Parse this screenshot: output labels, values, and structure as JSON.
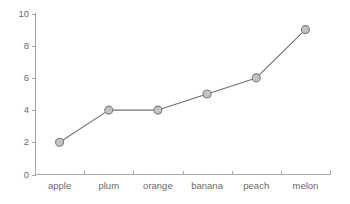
{
  "chart_data": {
    "type": "line",
    "title": "",
    "subtitle": "",
    "xlabel": "",
    "ylabel": "",
    "categories": [
      "apple",
      "plum",
      "orange",
      "banana",
      "peach",
      "melon"
    ],
    "values": [
      2,
      4,
      4,
      5,
      6,
      9
    ],
    "series": [
      {
        "name": "",
        "values": [
          2,
          4,
          4,
          5,
          6,
          9
        ]
      }
    ],
    "ylim": [
      0,
      10
    ],
    "ytick_labels": [
      "0",
      "2",
      "4",
      "6",
      "8",
      "10"
    ],
    "ytick_values": [
      0,
      2,
      4,
      6,
      8,
      10
    ],
    "grid": false,
    "legend": false,
    "legend_position": "none",
    "annotations": [],
    "marker": "circle",
    "xtick_style": "category-boundaries",
    "colors": {
      "background": "#ffffff",
      "axis": "#a6a6a6",
      "line": "#6f6f6f",
      "marker_fill": "#c3c3c3",
      "marker_stroke": "#7d7d7d",
      "text": "#6b6b6b"
    }
  },
  "axes": {
    "y_axis_name": "y-axis",
    "x_axis_name": "x-axis"
  }
}
